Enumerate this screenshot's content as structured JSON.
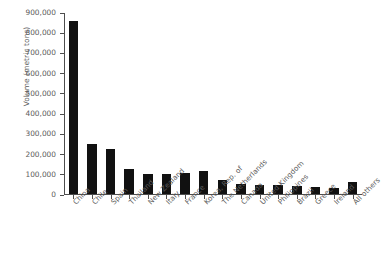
{
  "chart_data": {
    "type": "bar",
    "title": "",
    "subtitle": "",
    "xlabel": "",
    "ylabel": "Volume (metric tons)",
    "ylim": [
      0,
      900000
    ],
    "ytick_labels": [
      "900,000",
      "800,000",
      "700,000",
      "600,000",
      "500,000",
      "400,000",
      "300,000",
      "200,000",
      "100,000",
      "0"
    ],
    "ytick_values": [
      900000,
      800000,
      700000,
      600000,
      500000,
      400000,
      300000,
      200000,
      100000,
      0
    ],
    "grid": false,
    "legend": false,
    "bar_color": "#111111",
    "categories": [
      "China",
      "Chile",
      "Spain",
      "Thailand",
      "New Zealand",
      "Italy",
      "France",
      "Korea, Rep. of",
      "The Netherlands",
      "Canada",
      "United Kingdom",
      "Philippines",
      "Brazil",
      "Greece",
      "Ireland",
      "All others"
    ],
    "values": [
      855000,
      247000,
      222000,
      124000,
      99000,
      99000,
      104000,
      114000,
      69000,
      49000,
      44000,
      44000,
      40000,
      35000,
      30000,
      59000
    ]
  },
  "axes": {
    "y_title": "Volume (metric tons)",
    "axis_color": "#4d4d4d",
    "text_color": "#5c5c5c"
  }
}
